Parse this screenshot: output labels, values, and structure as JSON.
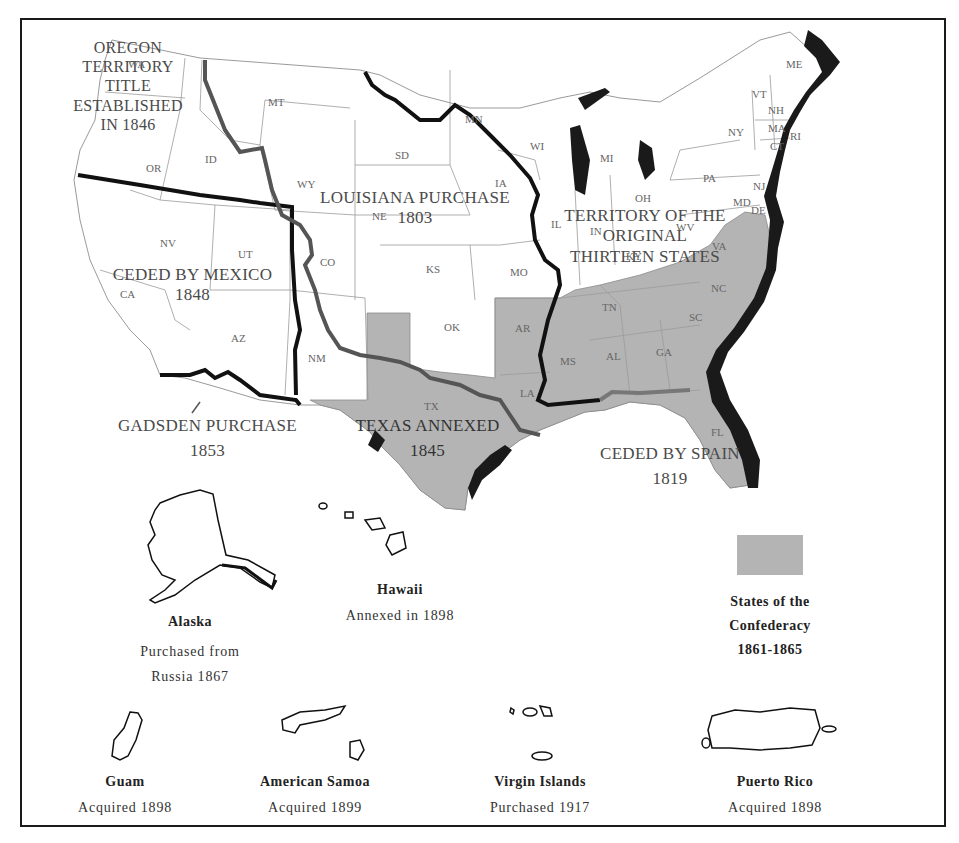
{
  "map": {
    "title": "United States Territorial Acquisitions",
    "region_labels": {
      "oregon": [
        "OREGON",
        "TERRITORY",
        "TITLE",
        "ESTABLISHED",
        "IN 1846"
      ],
      "louisiana": [
        "LOUISIANA PURCHASE",
        "1803"
      ],
      "mexico": [
        "CEDED BY MEXICO",
        "1848"
      ],
      "original13": [
        "TERRITORY OF THE",
        "ORIGINAL",
        "THIRTEEN STATES"
      ],
      "gadsden": [
        "GADSDEN PURCHASE",
        "1853"
      ],
      "texas": [
        "TEXAS ANNEXED",
        "1845"
      ],
      "spain": [
        "CEDED BY SPAIN",
        "1819"
      ]
    },
    "states": [
      "WA",
      "OR",
      "ID",
      "MT",
      "WY",
      "NV",
      "CA",
      "UT",
      "AZ",
      "CO",
      "NM",
      "SD",
      "NE",
      "KS",
      "OK",
      "TX",
      "MN",
      "IA",
      "MO",
      "AR",
      "LA",
      "WI",
      "IL",
      "MI",
      "IN",
      "OH",
      "KY",
      "TN",
      "MS",
      "AL",
      "GA",
      "FL",
      "SC",
      "NC",
      "VA",
      "WV",
      "PA",
      "NY",
      "VT",
      "NH",
      "ME",
      "MA",
      "RI",
      "CT",
      "NJ",
      "MD",
      "DE"
    ],
    "state_label_text": {
      "WA": "WA",
      "OR": "OR",
      "ID": "ID",
      "MT": "MT",
      "WY": "WY",
      "NV": "NV",
      "CA": "CA",
      "UT": "UT",
      "AZ": "AZ",
      "CO": "CO",
      "NM": "NM",
      "SD": "SD",
      "NE": "NE",
      "KS": "KS",
      "OK": "OK",
      "TX": "TX",
      "MN": "MN",
      "IA": "IA",
      "MO": "MO",
      "AR": "AR",
      "LA": "LA",
      "WI": "WI",
      "IL": "IL",
      "MI": "MI",
      "IN": "IN",
      "OH": "OH",
      "KY": "KY",
      "TN": "TN",
      "MS": "MS",
      "AL": "AL",
      "GA": "GA",
      "FL": "FL",
      "SC": "SC",
      "NC": "NC",
      "VA": "VA",
      "WV": "WV",
      "PA": "PA",
      "NY": "NY",
      "VT": "VT",
      "NH": "NH",
      "ME": "ME",
      "MA": "MA",
      "RI": "RI",
      "CT": "CT",
      "NJ": "NJ",
      "MD": "MD",
      "DE": "DE"
    },
    "confederate_states": [
      "TX",
      "AR",
      "LA",
      "MS",
      "AL",
      "TN",
      "GA",
      "FL",
      "SC",
      "NC",
      "VA"
    ],
    "colors": {
      "confederacy_fill": "#b4b4b4",
      "land_fill": "#ffffff",
      "state_border": "#9a9a9a",
      "acquisition_border": "#111111",
      "secondary_border": "#555555",
      "coast_shadow": "#1a1a1a"
    }
  },
  "legend": {
    "label_lines": [
      "States of the",
      "Confederacy",
      "1861-1865"
    ]
  },
  "insets": {
    "alaska": {
      "name": "Alaska",
      "lines": [
        "Purchased from",
        "Russia 1867"
      ]
    },
    "hawaii": {
      "name": "Hawaii",
      "lines": [
        "Annexed in 1898"
      ]
    },
    "guam": {
      "name": "Guam",
      "lines": [
        "Acquired 1898"
      ]
    },
    "samoa": {
      "name": "American Samoa",
      "lines": [
        "Acquired 1899"
      ]
    },
    "virgin": {
      "name": "Virgin Islands",
      "lines": [
        "Purchased 1917"
      ]
    },
    "puerto_rico": {
      "name": "Puerto Rico",
      "lines": [
        "Acquired 1898"
      ]
    }
  }
}
